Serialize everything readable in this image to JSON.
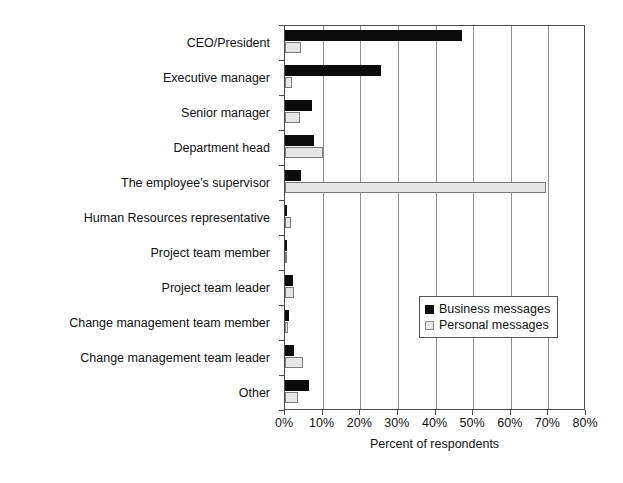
{
  "chart_data": {
    "type": "bar",
    "orientation": "horizontal",
    "title": "",
    "xlabel": "Percent of respondents",
    "ylabel": "",
    "xlim": [
      0,
      80
    ],
    "xticks": [
      "0%",
      "10%",
      "20%",
      "30%",
      "40%",
      "50%",
      "60%",
      "70%",
      "80%"
    ],
    "xtick_values": [
      0,
      10,
      20,
      30,
      40,
      50,
      60,
      70,
      80
    ],
    "grid": true,
    "grid_axis": "x",
    "legend_position": "center-right",
    "categories": [
      "CEO/President",
      "Executive manager",
      "Senior manager",
      "Department head",
      "The employee's supervisor",
      "Human Resources representative",
      "Project team member",
      "Project team leader",
      "Change management team member",
      "Change management team leader",
      "Other"
    ],
    "series": [
      {
        "name": "Business messages",
        "color": "#0b0b0b",
        "values": [
          47.0,
          25.5,
          7.2,
          7.7,
          4.3,
          0.4,
          0.2,
          2.0,
          1.0,
          2.5,
          6.5
        ]
      },
      {
        "name": "Personal messages",
        "color": "#e6e6e6",
        "values": [
          4.3,
          1.8,
          4.0,
          10.0,
          69.4,
          1.6,
          0.2,
          2.3,
          0.8,
          4.8,
          3.5
        ]
      }
    ]
  },
  "legend": {
    "items": [
      {
        "label": "Business messages",
        "swatch": "filled-black-square-icon"
      },
      {
        "label": "Personal messages",
        "swatch": "outlined-light-square-icon"
      }
    ]
  }
}
